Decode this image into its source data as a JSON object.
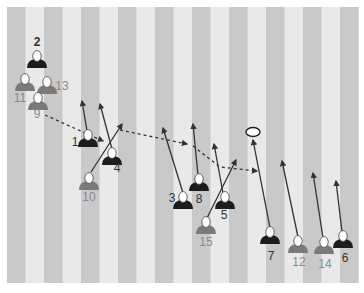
{
  "diagram": {
    "type": "rugby-play",
    "colors": {
      "stripe_dark": "#c9c9c9",
      "stripe_light": "#e9e9e9",
      "team_dark": "#1c1c1c",
      "team_grey": "#7a7a7a",
      "label_dark": "#333333",
      "label_grey": "#8a8a8a",
      "line": "#333333",
      "ball": "#ffffff"
    },
    "players": [
      {
        "number": "2",
        "team": "dark"
      },
      {
        "number": "11",
        "team": "grey"
      },
      {
        "number": "13",
        "team": "grey"
      },
      {
        "number": "9",
        "team": "grey"
      },
      {
        "number": "1",
        "team": "dark"
      },
      {
        "number": "4",
        "team": "dark"
      },
      {
        "number": "10",
        "team": "grey"
      },
      {
        "number": "3",
        "team": "dark"
      },
      {
        "number": "8",
        "team": "dark"
      },
      {
        "number": "5",
        "team": "dark"
      },
      {
        "number": "15",
        "team": "grey"
      },
      {
        "number": "7",
        "team": "dark"
      },
      {
        "number": "12",
        "team": "grey"
      },
      {
        "number": "14",
        "team": "grey"
      },
      {
        "number": "6",
        "team": "dark"
      }
    ],
    "runs": [
      {
        "player": "1"
      },
      {
        "player": "4"
      },
      {
        "player": "10"
      },
      {
        "player": "3"
      },
      {
        "player": "8"
      },
      {
        "player": "5"
      },
      {
        "player": "15"
      },
      {
        "player": "7"
      },
      {
        "player": "12"
      },
      {
        "player": "14"
      },
      {
        "player": "6"
      }
    ],
    "passes": [
      {
        "from": "9",
        "to": "1"
      },
      {
        "from": "10",
        "to": "3"
      },
      {
        "from": "8",
        "to": "7"
      }
    ],
    "ball": {
      "label": "ball"
    }
  }
}
